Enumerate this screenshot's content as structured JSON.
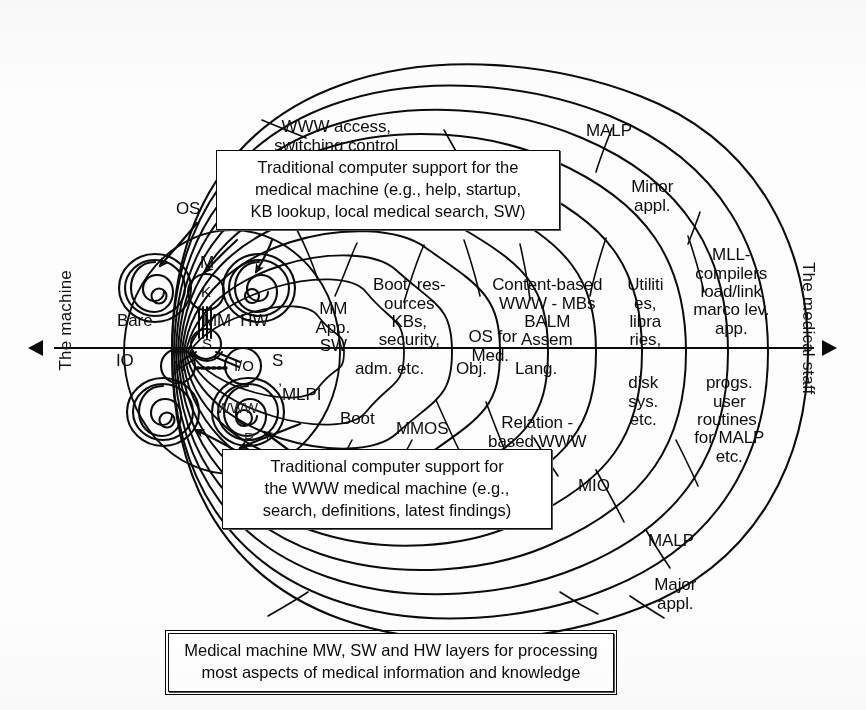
{
  "figure": {
    "type": "concentric-layer-diagram",
    "axis": {
      "left_label": "The machine",
      "right_label": "The medical staff"
    }
  },
  "callout_boxes": [
    {
      "id": "top-callout",
      "lines": [
        "Traditional computer support for the",
        "medical machine (e.g., help, startup,",
        "KB lookup, local medical search, SW)"
      ]
    },
    {
      "id": "bottom-callout",
      "lines": [
        "Traditional computer support for",
        "the WWW medical machine (e.g.,",
        "search, definitions, latest findings)"
      ]
    },
    {
      "id": "caption-box",
      "lines": [
        "Medical machine MW, SW and HW layers for processing",
        "most aspects of medical information and knowledge"
      ]
    }
  ],
  "upper_labels": [
    {
      "id": "www-access",
      "lines": [
        "WWW access,",
        "switching control"
      ]
    },
    {
      "id": "malp-minor",
      "lines": [
        "MALP"
      ]
    },
    {
      "id": "minor-appl",
      "lines": [
        "Minor",
        "appl."
      ]
    },
    {
      "id": "mll-compilers",
      "lines": [
        "MLL-",
        "compilers",
        "load/link",
        "marco lev.",
        "app."
      ]
    },
    {
      "id": "utilities",
      "lines": [
        "Utiliti",
        "es,",
        "libra",
        "ries,"
      ]
    },
    {
      "id": "content-based",
      "lines": [
        "Content-based",
        "WWW - MBs",
        "BALM",
        "Assem"
      ]
    },
    {
      "id": "os-for-med",
      "lines": [
        "OS for",
        "Med."
      ]
    },
    {
      "id": "boot-resources",
      "lines": [
        "Boot  res-",
        "ources",
        "KBs,",
        "security,"
      ]
    },
    {
      "id": "mm-app-sw",
      "lines": [
        "MM",
        "App.",
        "SW"
      ]
    },
    {
      "id": "os-arrow",
      "lines": [
        "OS"
      ]
    },
    {
      "id": "bare",
      "lines": [
        "Bare"
      ]
    },
    {
      "id": "mm-hw",
      "lines": [
        "MM  HW"
      ]
    },
    {
      "id": "node-m-top",
      "lines": [
        "M"
      ]
    },
    {
      "id": "node-k",
      "lines": [
        "K"
      ]
    }
  ],
  "lower_labels": [
    {
      "id": "io",
      "lines": [
        "IO"
      ]
    },
    {
      "id": "node-m-left",
      "lines": [
        "M"
      ]
    },
    {
      "id": "node-io",
      "lines": [
        "I/O"
      ]
    },
    {
      "id": "node-s",
      "lines": [
        "S"
      ]
    },
    {
      "id": "node-www",
      "lines": [
        "WWW"
      ]
    },
    {
      "id": "node-p",
      "lines": [
        "P"
      ]
    },
    {
      "id": "s-mlpi",
      "lines": [
        "S",
        ",",
        "MLPI"
      ]
    },
    {
      "id": "boot",
      "lines": [
        "Boot"
      ]
    },
    {
      "id": "mmos",
      "lines": [
        "MMOS"
      ]
    },
    {
      "id": "adm-etc",
      "lines": [
        "adm. etc."
      ]
    },
    {
      "id": "obj",
      "lines": [
        "Obj."
      ]
    },
    {
      "id": "lang",
      "lines": [
        "Lang."
      ]
    },
    {
      "id": "relation-based",
      "lines": [
        "Relation -",
        "based WWW"
      ]
    },
    {
      "id": "disk-sys",
      "lines": [
        "disk",
        "sys.",
        "etc."
      ]
    },
    {
      "id": "progs-user",
      "lines": [
        "progs.",
        "user",
        "routines,",
        "for MALP",
        "etc."
      ]
    },
    {
      "id": "mio",
      "lines": [
        "MIO"
      ]
    },
    {
      "id": "malp-major",
      "lines": [
        "MALP"
      ]
    },
    {
      "id": "major-appl",
      "lines": [
        "Major",
        "appl."
      ]
    }
  ]
}
